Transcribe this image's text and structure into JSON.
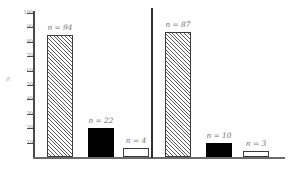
{
  "chart_data": {
    "type": "bar",
    "title": "",
    "xlabel": "",
    "ylabel": "%",
    "ylim": [
      0,
      100
    ],
    "grid": false,
    "legend": null,
    "y_ticks": [
      100,
      90,
      80,
      70,
      60,
      50,
      40,
      30,
      20,
      10
    ],
    "panels": [
      {
        "name": "left-panel",
        "bars": [
          {
            "label": "n = 94",
            "count": 94,
            "value": 85,
            "style": "hatched"
          },
          {
            "label": "n = 22",
            "count": 22,
            "value": 20,
            "style": "solid"
          },
          {
            "label": "n = 4",
            "count": 4,
            "value": 6,
            "style": "open"
          }
        ]
      },
      {
        "name": "right-panel",
        "bars": [
          {
            "label": "n = 87",
            "count": 87,
            "value": 87,
            "style": "hatched"
          },
          {
            "label": "n = 10",
            "count": 10,
            "value": 10,
            "style": "solid"
          },
          {
            "label": "n = 3",
            "count": 3,
            "value": 4,
            "style": "open"
          }
        ]
      }
    ]
  },
  "axis": {
    "y_title": "%",
    "tick_labels": [
      "100",
      "90",
      "80",
      "70",
      "60",
      "50",
      "40",
      "30",
      "20",
      "10"
    ]
  },
  "colors": {
    "axis": "#4a4a4a",
    "baseline": "#6b6b6b",
    "divider": "#2f2f2f",
    "hatch": "#5a5a5a",
    "solid_bar": "#000000",
    "open_bar": "#ffffff",
    "tick_text": "#8a8a8a",
    "bar_label_text": "#6e6e6e",
    "background": "#ffffff"
  }
}
